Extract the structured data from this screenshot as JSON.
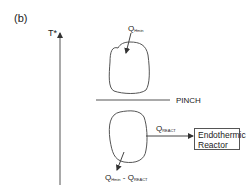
{
  "diagram": {
    "panel_label": "(b)",
    "axis": {
      "label": "T*",
      "direction": "up"
    },
    "pinch": {
      "label": "PINCH"
    },
    "above_pinch": {
      "heat_input": {
        "symbol": "Q",
        "subscript": "Hmin"
      }
    },
    "below_pinch": {
      "heat_to_reactor": {
        "symbol": "Q",
        "subscript": "REACT"
      },
      "heat_output": {
        "symbol": "Q",
        "subscript": "Hmin",
        "minus": " - ",
        "symbol2": "Q",
        "subscript2": "REACT"
      }
    },
    "reactor": {
      "line1": "Endothermic",
      "line2": "Reactor"
    },
    "colors": {
      "stroke": "#444444",
      "text": "#222222",
      "background": "#ffffff"
    }
  }
}
